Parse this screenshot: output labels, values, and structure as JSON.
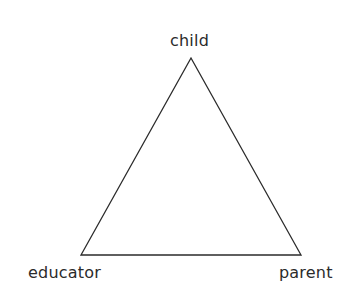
{
  "diagram": {
    "type": "triangle",
    "stroke_color": "#2b2b2b",
    "fill_color": "#ffffff",
    "vertices": {
      "top": {
        "label": "child",
        "x": 191,
        "y": 58
      },
      "bottom_left": {
        "label": "educator",
        "x": 81,
        "y": 255
      },
      "bottom_right": {
        "label": "parent",
        "x": 301,
        "y": 255
      }
    },
    "labels": {
      "top": "child",
      "bottom_left": "educator",
      "bottom_right": "parent"
    },
    "edges": [
      {
        "from": "child",
        "to": "educator"
      },
      {
        "from": "educator",
        "to": "parent"
      },
      {
        "from": "parent",
        "to": "child"
      }
    ]
  }
}
